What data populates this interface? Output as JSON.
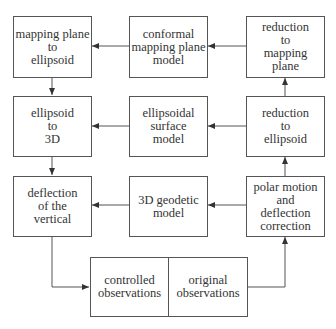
{
  "diagram": {
    "type": "flowchart",
    "nodes": [
      {
        "id": "mapping-plane-to-ellipsoid",
        "label": "mapping plane\nto\nellipsoid"
      },
      {
        "id": "conformal-mapping-plane-model",
        "label": "conformal\nmapping plane\nmodel"
      },
      {
        "id": "reduction-to-mapping-plane",
        "label": "reduction\nto\nmapping\nplane"
      },
      {
        "id": "ellipsoid-to-3d",
        "label": "ellipsoid\nto\n3D"
      },
      {
        "id": "ellipsoidal-surface-model",
        "label": "ellipsoidal\nsurface\nmodel"
      },
      {
        "id": "reduction-to-ellipsoid",
        "label": "reduction\nto\nellipsoid"
      },
      {
        "id": "deflection-of-the-vertical",
        "label": "deflection\nof the\nvertical"
      },
      {
        "id": "3d-geodetic-model",
        "label": "3D geodetic\nmodel"
      },
      {
        "id": "polar-motion-and-deflection-correction",
        "label": "polar motion\nand\ndeflection\ncorrection"
      },
      {
        "id": "controlled-observations",
        "label": "controlled\nobservations"
      },
      {
        "id": "original-observations",
        "label": "original\nobservations"
      }
    ],
    "edges": [
      {
        "from": "conformal-mapping-plane-model",
        "to": "mapping-plane-to-ellipsoid"
      },
      {
        "from": "reduction-to-mapping-plane",
        "to": "conformal-mapping-plane-model"
      },
      {
        "from": "mapping-plane-to-ellipsoid",
        "to": "ellipsoid-to-3d"
      },
      {
        "from": "reduction-to-ellipsoid",
        "to": "reduction-to-mapping-plane"
      },
      {
        "from": "ellipsoidal-surface-model",
        "to": "ellipsoid-to-3d"
      },
      {
        "from": "reduction-to-ellipsoid",
        "to": "ellipsoidal-surface-model"
      },
      {
        "from": "ellipsoid-to-3d",
        "to": "deflection-of-the-vertical"
      },
      {
        "from": "polar-motion-and-deflection-correction",
        "to": "reduction-to-ellipsoid"
      },
      {
        "from": "3d-geodetic-model",
        "to": "deflection-of-the-vertical"
      },
      {
        "from": "polar-motion-and-deflection-correction",
        "to": "3d-geodetic-model"
      },
      {
        "from": "deflection-of-the-vertical",
        "to": "controlled-observations"
      },
      {
        "from": "original-observations",
        "to": "polar-motion-and-deflection-correction"
      }
    ]
  },
  "colors": {
    "line": "#555555",
    "text": "#333333",
    "background": "#ffffff"
  }
}
